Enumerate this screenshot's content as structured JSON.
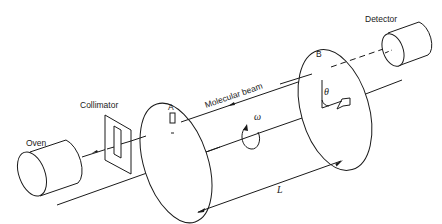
{
  "diagram": {
    "labels": {
      "oven": "Oven",
      "collimator": "Collimator",
      "disk_a": "A",
      "disk_b": "B",
      "molecular_beam": "Molecular beam",
      "detector": "Detector",
      "omega": "ω",
      "theta": "θ",
      "length": "L"
    },
    "components": [
      {
        "id": "oven",
        "shape": "cylinder"
      },
      {
        "id": "collimator",
        "shape": "slit-plate"
      },
      {
        "id": "disk_a",
        "shape": "slotted-disk"
      },
      {
        "id": "disk_b",
        "shape": "slotted-disk",
        "slot_offset_angle": "θ"
      },
      {
        "id": "detector",
        "shape": "cylinder"
      }
    ],
    "colors": {
      "ink": "#1a1a1a",
      "background": "#ffffff"
    }
  }
}
